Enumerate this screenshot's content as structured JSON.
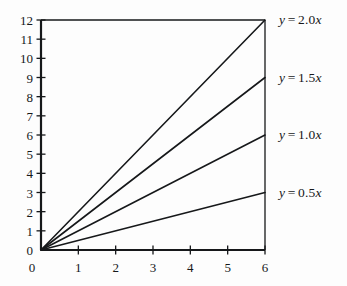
{
  "chart_data": {
    "type": "line",
    "title": "",
    "subtitle": "",
    "xlabel": "",
    "ylabel": "",
    "xlim": [
      0,
      6
    ],
    "ylim": [
      0,
      12
    ],
    "grid": false,
    "legend_position": "right-of-line-ends",
    "x_ticks": [
      "0",
      "1",
      "2",
      "3",
      "4",
      "5",
      "6"
    ],
    "y_ticks": [
      "0",
      "1",
      "2",
      "3",
      "4",
      "5",
      "6",
      "7",
      "8",
      "9",
      "10",
      "11",
      "12"
    ],
    "x": [
      0,
      6
    ],
    "series": [
      {
        "name": "y = 2.0x",
        "slope": 2.0,
        "values": [
          0,
          12
        ],
        "label_parts": {
          "var_y": "y",
          "eq": "=",
          "coef": "2.0",
          "var_x": "x"
        },
        "label_at_y": 12
      },
      {
        "name": "y = 1.5x",
        "slope": 1.5,
        "values": [
          0,
          9
        ],
        "label_parts": {
          "var_y": "y",
          "eq": "=",
          "coef": "1.5",
          "var_x": "x"
        },
        "label_at_y": 9
      },
      {
        "name": "y = 1.0x",
        "slope": 1.0,
        "values": [
          0,
          6
        ],
        "label_parts": {
          "var_y": "y",
          "eq": "=",
          "coef": "1.0",
          "var_x": "x"
        },
        "label_at_y": 6
      },
      {
        "name": "y = 0.5x",
        "slope": 0.5,
        "values": [
          0,
          3
        ],
        "label_parts": {
          "var_y": "y",
          "eq": "=",
          "coef": "0.5",
          "var_x": "x"
        },
        "label_at_y": 3
      }
    ],
    "colors": {
      "background": "#fdfdfd",
      "line": "#16181a",
      "axis": "#16181a",
      "text": "#16181a"
    }
  }
}
